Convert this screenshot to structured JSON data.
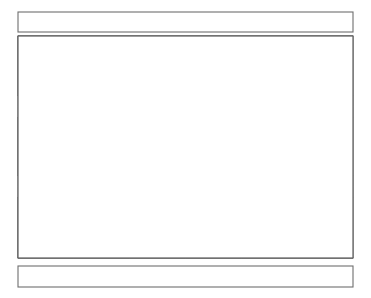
{
  "figure": {
    "title": "",
    "type": "geometric-tessellation-diagram",
    "background_color": "#ffffff",
    "line_color": "#3a3a3a",
    "accent_gray": "#9c9c9c",
    "border_color": "#5d5d5d"
  },
  "banners": {
    "top": {
      "label": "",
      "x": 18,
      "y": 12,
      "width": 335,
      "height": 20
    },
    "bottom": {
      "label": "",
      "x": 18,
      "y": 266,
      "width": 335,
      "height": 21
    }
  },
  "panel": {
    "x": 18,
    "y": 36,
    "width": 335,
    "height": 222,
    "columns": 6,
    "rows": 5,
    "cell_width": 55.83,
    "row_boundaries": [
      36,
      96,
      117,
      176,
      197,
      258
    ]
  },
  "bands": [
    {
      "name": "triangle-band-top",
      "kind": "triangle",
      "y": 36,
      "height": 60
    },
    {
      "name": "diamond-band-upper",
      "kind": "diamond",
      "y": 96,
      "height": 21,
      "fill": "#9c9c9c"
    },
    {
      "name": "triangle-band-middle",
      "kind": "triangle",
      "y": 117,
      "height": 59
    },
    {
      "name": "diamond-band-lower",
      "kind": "diamond",
      "y": 176,
      "height": 21,
      "fill": "#9c9c9c"
    },
    {
      "name": "triangle-band-bottom",
      "kind": "triangle",
      "y": 197,
      "height": 61
    }
  ],
  "textures": {
    "legend": [
      "plain",
      "horizontal-lines",
      "squiggle",
      "stipple",
      "diagonal-lines",
      "fine-hatch"
    ],
    "band_top": [
      [
        "plain",
        "fine-hatch",
        "horizontal-lines",
        "plain"
      ],
      [
        "stipple",
        "squiggle",
        "horizontal-lines",
        "horizontal-lines"
      ],
      [
        "plain",
        "horizontal-lines",
        "plain",
        "plain"
      ],
      [
        "plain",
        "plain",
        "horizontal-lines",
        "plain"
      ],
      [
        "squiggle",
        "horizontal-lines",
        "diagonal-lines",
        "fine-hatch"
      ],
      [
        "horizontal-lines",
        "plain",
        "plain",
        "horizontal-lines"
      ]
    ],
    "band_middle": [
      [
        "plain",
        "fine-hatch",
        "horizontal-lines",
        "horizontal-lines"
      ],
      [
        "plain",
        "plain",
        "plain",
        "plain"
      ],
      [
        "fine-hatch",
        "horizontal-lines",
        "plain",
        "diagonal-lines"
      ],
      [
        "plain",
        "plain",
        "horizontal-lines",
        "plain"
      ],
      [
        "diagonal-lines",
        "squiggle",
        "plain",
        "squiggle"
      ],
      [
        "squiggle",
        "horizontal-lines",
        "horizontal-lines",
        "plain"
      ]
    ],
    "band_bottom": [
      [
        "plain",
        "plain",
        "horizontal-lines",
        "fine-hatch"
      ],
      [
        "plain",
        "plain",
        "diagonal-lines",
        "plain"
      ],
      [
        "squiggle",
        "plain",
        "plain",
        "horizontal-lines"
      ],
      [
        "plain",
        "horizontal-lines",
        "horizontal-lines",
        "plain"
      ],
      [
        "plain",
        "plain",
        "horizontal-lines",
        "squiggle"
      ],
      [
        "horizontal-lines",
        "fine-hatch",
        "plain",
        "plain"
      ]
    ]
  }
}
